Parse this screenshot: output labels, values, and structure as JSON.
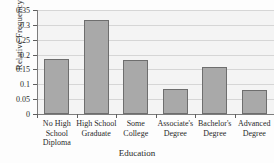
{
  "chart_data": {
    "type": "bar",
    "title": "Relative Frequencies of Education",
    "xlabel": "Education",
    "ylabel": "Relative Frequency",
    "categories": [
      "No High School Diploma",
      "High School Graduate",
      "Some College",
      "Associate's Degree",
      "Bachelor's Degree",
      "Advanced Degree"
    ],
    "category_lines": [
      [
        "No High",
        "School",
        "Diploma"
      ],
      [
        "High School",
        "Graduate"
      ],
      [
        "Some",
        "College"
      ],
      [
        "Associate's",
        "Degree"
      ],
      [
        "Bachelor's",
        "Degree"
      ],
      [
        "Advanced",
        "Degree"
      ]
    ],
    "values": [
      0.185,
      0.318,
      0.182,
      0.083,
      0.159,
      0.08
    ],
    "ylim": [
      0,
      0.35
    ],
    "yticks": [
      0,
      0.05,
      0.1,
      0.15,
      0.2,
      0.25,
      0.3,
      0.35
    ],
    "ytick_labels": [
      "0",
      "0.05",
      "0.1",
      "0.15",
      "0.2",
      "0.25",
      "0.3",
      "0.35"
    ],
    "grid": true,
    "legend": "none",
    "bar_color": "#a9a9a9",
    "bar_edge_color": "#6e6e6e",
    "plot_background": "#f4f4f4",
    "axis_color": "#7d7d7d",
    "gridline_color": "#d6d6d6"
  }
}
